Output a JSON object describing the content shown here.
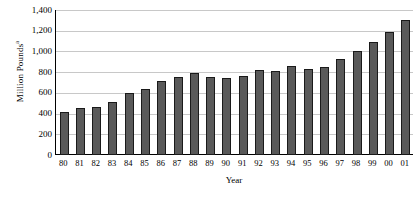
{
  "chart_data": {
    "type": "bar",
    "title": "",
    "xlabel": "Year",
    "ylabel": "Million Pounds",
    "ylabel_superscript": "a",
    "categories": [
      "80",
      "81",
      "82",
      "83",
      "84",
      "85",
      "86",
      "87",
      "88",
      "89",
      "90",
      "91",
      "92",
      "93",
      "94",
      "95",
      "96",
      "97",
      "98",
      "99",
      "00",
      "01"
    ],
    "values": [
      420,
      450,
      465,
      510,
      600,
      635,
      710,
      755,
      790,
      750,
      740,
      765,
      820,
      810,
      855,
      830,
      850,
      930,
      1000,
      1090,
      1190,
      1300
    ],
    "ylim": [
      0,
      1400
    ],
    "ytick_values": [
      0,
      200,
      400,
      600,
      800,
      1000,
      1200,
      1400
    ],
    "ytick_labels": [
      "0",
      "200",
      "400",
      "600",
      "800",
      "1,000",
      "1,200",
      "1,400"
    ],
    "grid": true,
    "grid_axis": "y",
    "legend": "none",
    "bar_color": "#595959",
    "bar_edge_color": "#1a1a1a",
    "grid_color": "#c8c8c8",
    "axis_color": "#000000",
    "background_color": "#ffffff"
  }
}
